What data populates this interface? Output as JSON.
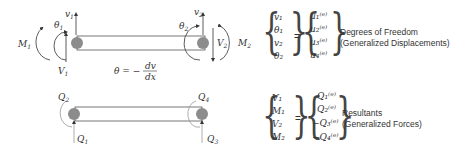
{
  "top_diagram": {
    "labels": {
      "v1": "v",
      "v1_sub": "1",
      "theta1": "θ",
      "theta1_sub": "1",
      "M1": "M",
      "M1_sub": "1",
      "V1": "V",
      "V1_sub": "1",
      "v2": "v",
      "v2_sub": "2",
      "theta2": "θ",
      "theta2_sub": "2",
      "V2": "V",
      "V2_sub": "2",
      "M2": "M",
      "M2_sub": "2"
    },
    "equation": {
      "lhs": "θ = −",
      "num": "dv",
      "den": "dx"
    }
  },
  "bottom_diagram": {
    "labels": {
      "Q1": "Q",
      "Q1_sub": "1",
      "Q2": "Q",
      "Q2_sub": "2",
      "Q3": "Q",
      "Q3_sub": "3",
      "Q4": "Q",
      "Q4_sub": "4"
    }
  },
  "dof_vector": {
    "lhs": [
      "v₁",
      "θ₁",
      "v₂",
      "θ₂"
    ],
    "rhs": [
      "u₁⁽ᵉ⁾",
      "u₂⁽ᵉ⁾",
      "u₃⁽ᵉ⁾",
      "u₄⁽ᵉ⁾"
    ],
    "equals": "=",
    "caption_line1": "Degrees of Freedom",
    "caption_line2": "(Generalized Displacements)"
  },
  "resultant_vector": {
    "lhs": [
      "V₁",
      "M₁",
      "V₂",
      "M₂"
    ],
    "rhs": [
      "Q₁⁽ᵉ⁾",
      "Q₂⁽ᵉ⁾",
      "−Q₃⁽ᵉ⁾",
      "−Q₄⁽ᵉ⁾"
    ],
    "equals": "=",
    "caption_line1": "Resultants",
    "caption_line2": "(Generalized Forces)"
  },
  "colors": {
    "node": "#8c8c8c",
    "line": "#333333",
    "beam_fill": "#ffffff"
  }
}
